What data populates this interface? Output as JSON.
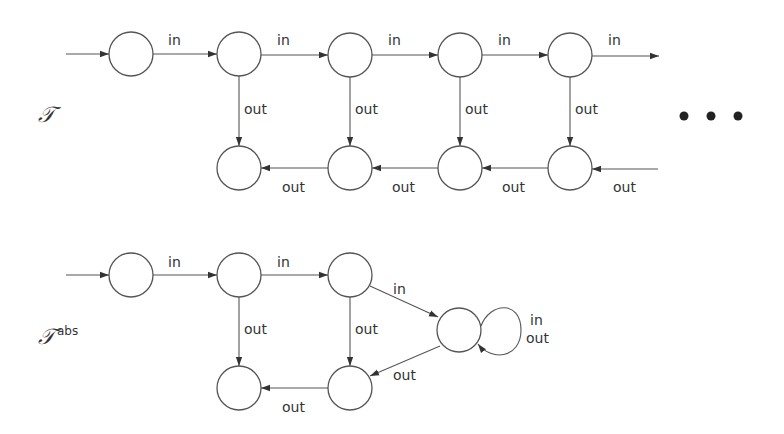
{
  "diagram": {
    "top": {
      "name": "T",
      "label": "𝒯",
      "edges": {
        "in1": "in",
        "in2": "in",
        "in3": "in",
        "in4": "in",
        "in5": "in",
        "down1": "out",
        "down2": "out",
        "down3": "out",
        "down4": "out",
        "back1": "out",
        "back2": "out",
        "back3": "out",
        "back4": "out"
      },
      "continuation": "• • •"
    },
    "bottom": {
      "name": "T abs",
      "label": "𝒯",
      "superscript": "abs",
      "edges": {
        "in1": "in",
        "in2": "in",
        "in3": "in",
        "down1": "out",
        "down2": "out",
        "back1": "out",
        "diag_out": "out",
        "loop_in": "in",
        "loop_out": "out"
      }
    },
    "colors": {
      "stroke": "#555555",
      "text": "#333333",
      "background": "#ffffff"
    }
  }
}
